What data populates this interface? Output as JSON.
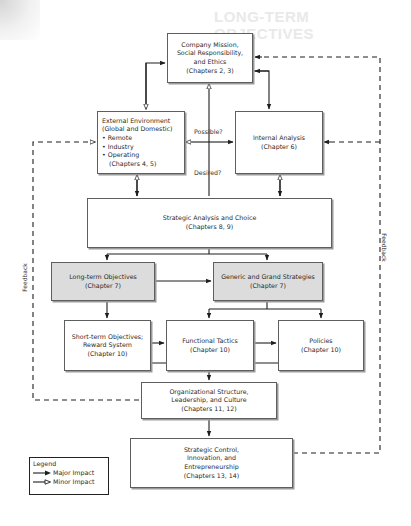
{
  "background": {
    "faint_heading": "LONG-TERM OBJECTIVES"
  },
  "boxes": {
    "mission": {
      "lines": [
        "Company Mission,",
        "Social Responsibility,",
        "and Ethics",
        "(Chapters 2, 3)"
      ]
    },
    "external": {
      "lines": [
        "External Environment",
        "(Global and Domestic)",
        "• Remote",
        "• Industry",
        "• Operating",
        "   (Chapters 4, 5)"
      ]
    },
    "internal": {
      "lines": [
        "Internal Analysis",
        "(Chapter 6)"
      ]
    },
    "strategic_analysis": {
      "lines": [
        "Strategic Analysis and Choice",
        "(Chapters 8, 9)"
      ]
    },
    "long_term": {
      "lines": [
        "Long-term Objectives",
        "(Chapter 7)"
      ],
      "fill": "#dcdcdc"
    },
    "generic_grand": {
      "lines": [
        "Generic and Grand Strategies",
        "(Chapter 7)"
      ],
      "fill": "#dcdcdc"
    },
    "short_term": {
      "lines": [
        "Short-term Objectives;",
        "Reward System",
        "(Chapter 10)"
      ]
    },
    "functional": {
      "lines": [
        "Functional Tactics",
        "(Chapter 10)"
      ]
    },
    "policies": {
      "lines": [
        "Policies",
        "(Chapter 10)"
      ]
    },
    "org_structure": {
      "lines": [
        "Organizational Structure,",
        "Leadership, and Culture",
        "(Chapters 11, 12)"
      ]
    },
    "strategic_control": {
      "lines": [
        "Strategic Control,",
        "Innovation, and",
        "Entrepreneurship",
        "(Chapters 13, 14)"
      ]
    }
  },
  "labels": {
    "possible": "Possible?",
    "desired": "Desired?",
    "feedback_left": "Feedback",
    "feedback_right": "Feedback"
  },
  "legend": {
    "title": "Legend",
    "items": [
      {
        "label": "Major Impact",
        "arrow": "filled"
      },
      {
        "label": "Minor Impact",
        "arrow": "hollow"
      }
    ]
  },
  "colors": {
    "line": "#1e1e1e",
    "border": "#5e5e5e",
    "shaded_fill": "#dcdcdc"
  }
}
